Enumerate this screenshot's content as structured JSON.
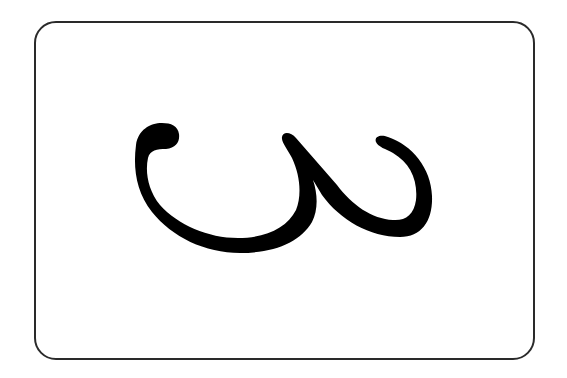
{
  "card": {
    "glyph_label": "Telugu numeral three (౩)",
    "glyph_char": "౩",
    "glyph_color": "#000000",
    "border_color": "#2a2a2a",
    "background_color": "#ffffff"
  }
}
